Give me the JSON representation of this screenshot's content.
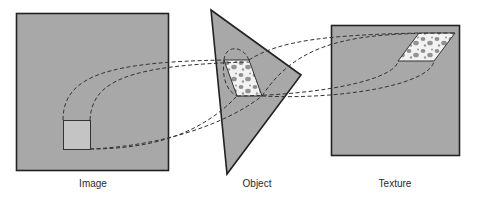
{
  "diagram": {
    "type": "texture-mapping-illustration",
    "colors": {
      "panel_fill": "#a8a8a8",
      "panel_stroke": "#222222",
      "pixel_fill": "#c4c4c4",
      "texture_patch_fill": "#f2f2f2",
      "texture_spot": "#8f8f8f",
      "dashed_line": "#333333",
      "background": "#ffffff"
    },
    "panels": [
      {
        "id": "image",
        "label": "Image",
        "shape": "square"
      },
      {
        "id": "object",
        "label": "Object",
        "shape": "triangle"
      },
      {
        "id": "texture",
        "label": "Texture",
        "shape": "square"
      }
    ],
    "elements": {
      "image_pixel": "pixel square in image space",
      "object_patch": "textured parallelogram on object surface",
      "texture_patch": "textured parallelogram in texture space"
    },
    "connections": [
      {
        "from": "image_pixel",
        "to": "object_patch",
        "style": "dashed"
      },
      {
        "from": "object_patch",
        "to": "texture_patch",
        "style": "dashed"
      }
    ]
  }
}
